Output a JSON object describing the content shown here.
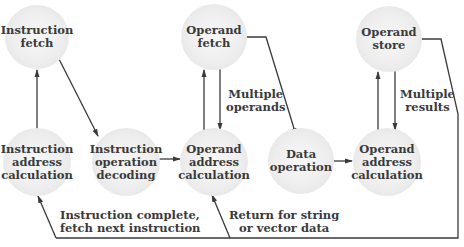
{
  "nodes": {
    "instruction_fetch": "Instruction\nfetch",
    "instruction_address_calculation": "Instruction\naddress\ncalculation",
    "instruction_operation_decoding": "Instruction\noperation\ndecoding",
    "operand_fetch": "Operand\nfetch",
    "operand_address_calculation_1": "Operand\naddress\ncalculation",
    "data_operation": "Data\noperation",
    "operand_store": "Operand\nstore",
    "operand_address_calculation_2": "Operand\naddress\ncalculation"
  },
  "labels": {
    "multiple_operands": "Multiple\noperands",
    "multiple_results": "Multiple\nresults",
    "instruction_complete": "Instruction complete,\nfetch next instruction",
    "return_for_string": "Return for string\nor vector data"
  },
  "colors": {
    "line": "#3a3a3a",
    "node_fill": "#eeeeee",
    "text": "#3a3a3a"
  }
}
